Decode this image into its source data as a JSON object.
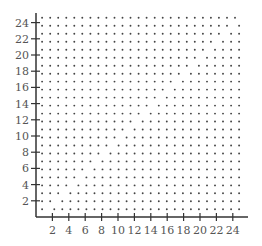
{
  "chart_data": {
    "type": "scatter",
    "title": "",
    "xlabel": "",
    "ylabel": "",
    "xlim": [
      0,
      25.5
    ],
    "ylim": [
      0,
      25
    ],
    "grid": false,
    "legend": null,
    "x_ticks": [
      2,
      4,
      6,
      8,
      10,
      12,
      14,
      16,
      18,
      20,
      22,
      24
    ],
    "y_ticks": [
      2,
      4,
      6,
      8,
      10,
      12,
      14,
      16,
      18,
      20,
      22,
      24
    ],
    "x_tick_labels": [
      "2",
      "4",
      "6",
      "8",
      "10",
      "12",
      "14",
      "16",
      "18",
      "20",
      "22",
      "24"
    ],
    "y_tick_labels": [
      "2",
      "4",
      "6",
      "8",
      "10",
      "12",
      "14",
      "16",
      "18",
      "20",
      "22",
      "24"
    ],
    "pattern": {
      "description": "25x25 dot lattice; in each row, dots right of the diagonal y=x are shifted by half a unit, creating a diagonal seam",
      "rows": 25,
      "cols": 25,
      "row_start_y": 0.95,
      "row_step": 0.985,
      "col_start_x": 0.75,
      "col_step": 0.98,
      "shift_after_diagonal": 0.5
    },
    "dot_color": "#444444",
    "axis_color": "#333333"
  }
}
